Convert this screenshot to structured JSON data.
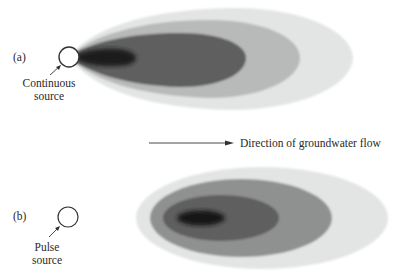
{
  "panels": {
    "a": {
      "label": "(a)",
      "source_label_line1": "Continuous",
      "source_label_line2": "source",
      "source_type": "continuous"
    },
    "b": {
      "label": "(b)",
      "source_label_line1": "Pulse",
      "source_label_line2": "source",
      "source_type": "pulse"
    }
  },
  "flow_arrow": {
    "label": "Direction of groundwater flow"
  },
  "colors": {
    "lightest": "#e3e5e5",
    "light": "#b8b9b9",
    "medium": "#8a8b8b",
    "dark": "#5e5f5f",
    "core": "#1c1c1c",
    "outline": "#333333"
  }
}
